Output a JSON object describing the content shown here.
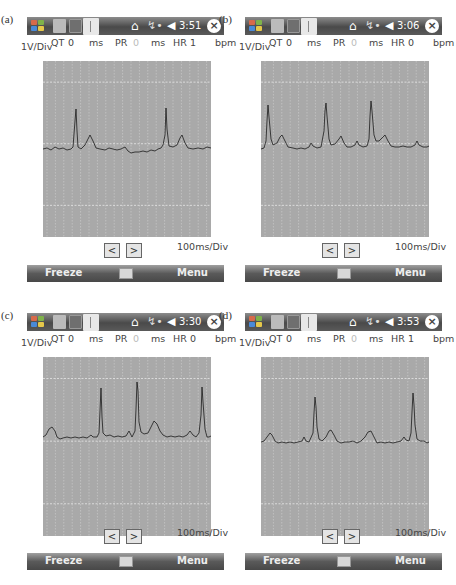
{
  "panels": [
    {
      "id": "a",
      "label": "(a)",
      "taskbar": {
        "time": "3:51",
        "icons": [
          "windows-start-icon",
          "app-icon-1",
          "camera-app-icon",
          "ecg-app-icon",
          "home-icon",
          "signal-icon",
          "volume-icon",
          "close-icon"
        ]
      },
      "readout": {
        "vdiv": "1V/Div",
        "qt_label": "QT",
        "qt_value": "0",
        "qt_unit": "ms",
        "pr_label": "PR",
        "pr_value": "0",
        "pr_unit": "ms",
        "hr_label": "HR",
        "hr_value": "1",
        "hr_unit": "bpm"
      },
      "nav": {
        "prev": "<",
        "next": ">"
      },
      "tdiv": "100ms/Div",
      "softkeys": {
        "left": "Freeze",
        "right": "Menu"
      }
    },
    {
      "id": "b",
      "label": "(b)",
      "taskbar": {
        "time": "3:06",
        "icons": [
          "windows-start-icon",
          "app-icon-1",
          "camera-app-icon",
          "ecg-app-icon",
          "home-icon",
          "signal-icon",
          "volume-icon",
          "close-icon"
        ]
      },
      "readout": {
        "vdiv": "1V/Div",
        "qt_label": "QT",
        "qt_value": "0",
        "qt_unit": "ms",
        "pr_label": "PR",
        "pr_value": "0",
        "pr_unit": "ms",
        "hr_label": "HR",
        "hr_value": "0",
        "hr_unit": "bpm"
      },
      "nav": {
        "prev": "<",
        "next": ">"
      },
      "tdiv": "100ms/Div",
      "softkeys": {
        "left": "Freeze",
        "right": "Menu"
      }
    },
    {
      "id": "c",
      "label": "(c)",
      "taskbar": {
        "time": "3:30",
        "icons": [
          "windows-start-icon",
          "app-icon-1",
          "camera-app-icon",
          "ecg-app-icon",
          "home-icon",
          "signal-icon",
          "volume-icon",
          "close-icon"
        ]
      },
      "readout": {
        "vdiv": "1V/Div",
        "qt_label": "QT",
        "qt_value": "0",
        "qt_unit": "ms",
        "pr_label": "PR",
        "pr_value": "0",
        "pr_unit": "ms",
        "hr_label": "HR",
        "hr_value": "0",
        "hr_unit": "bpm"
      },
      "nav": {
        "prev": "<",
        "next": ">"
      },
      "tdiv": "100ms/Div",
      "softkeys": {
        "left": "Freeze",
        "right": "Menu"
      }
    },
    {
      "id": "d",
      "label": "(d)",
      "taskbar": {
        "time": "3:53",
        "icons": [
          "windows-start-icon",
          "app-icon-1",
          "camera-app-icon",
          "ecg-app-icon",
          "home-icon",
          "signal-icon",
          "volume-icon",
          "close-icon"
        ]
      },
      "readout": {
        "vdiv": "1V/Div",
        "qt_label": "QT",
        "qt_value": "0",
        "qt_unit": "ms",
        "pr_label": "PR",
        "pr_value": "0",
        "pr_unit": "ms",
        "hr_label": "HR",
        "hr_value": "1",
        "hr_unit": "bpm"
      },
      "nav": {
        "prev": "<",
        "next": ">"
      },
      "tdiv": "100ms/Div",
      "softkeys": {
        "left": "Freeze",
        "right": "Menu"
      }
    }
  ],
  "colors": {
    "chart_bg": "#a9a9a9",
    "grid_minor": "#d0d0d0",
    "grid_major": "#e8e8e8",
    "trace": "#1a1a1a",
    "taskbar": "#5a5a5a"
  },
  "traces": {
    "a": "0,88 4,87 8,89 12,86 16,88 20,87 24,89 28,88 30,86 32,60 33,48 34,70 35,86 38,88 42,84 45,78 47,74 50,80 53,87 57,88 62,89 66,87 70,88 74,89 78,88 82,86 85,90 88,92 92,91 96,91 100,90 104,91 108,89 112,90 115,88 118,87 120,84 122,74 123,47 124,68 126,85 130,86 134,84 137,77 139,74 142,82 145,87 150,88 155,87 160,88 164,86 168,87",
    "b": "0,88 3,87 5,80 6,60 7,44 8,56 10,78 12,84 16,82 19,76 21,74 24,80 27,86 32,87 36,88 40,87 44,88 48,86 50,82 52,85 56,87 60,86 63,70 64,50 65,42 66,55 68,78 70,84 74,83 78,78 80,75 83,82 86,86 90,86 94,84 96,80 98,84 102,86 106,85 108,78 109,55 110,40 111,50 113,74 115,80 118,80 122,76 124,74 127,80 130,85 134,86 138,86 142,85 146,86 150,86 154,84 156,80 158,84 162,86 166,86 168,85",
    "c": "0,80 3,78 6,72 9,70 12,74 14,80 17,82 20,81 24,80 28,81 32,80 36,81 40,80 44,81 48,78 50,80 54,80 56,76 57,54 58,31 59,60 60,76 63,79 67,78 71,80 75,79 79,80 83,79 86,74 87,76 89,80 92,74 93,52 94,25 95,34 96,65 98,75 101,77 105,76 108,70 111,64 114,67 117,74 120,78 124,80 128,79 132,80 136,79 140,80 144,78 147,74 150,78 153,80 156,76 158,58 159,30 160,45 162,72 164,80 166,80 168,79",
    "d": "0,85 3,84 6,80 9,76 11,78 14,84 17,86 21,85 25,86 29,85 33,86 37,85 41,84 43,80 45,84 48,85 52,76 53,56 54,40 55,50 56,70 58,82 61,84 65,80 68,74 70,73 73,78 76,84 80,86 84,85 88,85 92,84 96,86 100,84 104,80 107,75 110,74 113,80 116,86 120,85 124,86 128,85 132,86 136,85 140,84 143,80 145,83 148,84 150,76 151,55 152,36 153,48 154,68 156,82 159,84 163,84 166,86 168,85"
  }
}
